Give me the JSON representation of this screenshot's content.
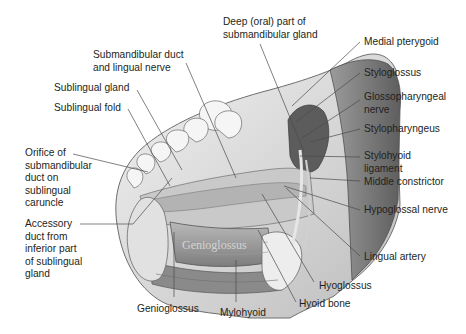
{
  "figure": {
    "colors": {
      "ink": "#231f20",
      "leader": "#4a4a4a",
      "tissue_light": "#d9d9d9",
      "tissue_mid": "#a8a8a8",
      "tissue_dark": "#6e6e6e",
      "bone": "#ececec",
      "background": "#ffffff"
    },
    "watermark_text": "Genioglossus"
  },
  "labels": {
    "deep_part": "Deep (oral) part of\nsubmandibular gland",
    "submandibular_duct": "Submandibular duct\nand lingual nerve",
    "sublingual_gland": "Sublingual gland",
    "sublingual_fold": "Sublingual fold",
    "orifice": "Orifice of\nsubmandibular\nduct on\nsublingual\ncaruncle",
    "accessory_duct": "Accessory\nduct from\ninferior part\nof sublingual\ngland",
    "genioglossus": "Genioglossus",
    "mylohyoid": "Mylohyoid",
    "hyoid_bone": "Hyoid bone",
    "hyoglossus": "Hyoglossus",
    "lingual_artery": "Lingual artery",
    "hypoglossal_nerve": "Hypoglossal nerve",
    "middle_constrictor": "Middle constrictor",
    "stylohyoid_ligament": "Stylohyoid\nligament",
    "stylopharyngeus": "Stylopharyngeus",
    "glossopharyngeal_nerve": "Glossopharyngeal\nnerve",
    "styloglossus": "Styloglossus",
    "medial_pterygoid": "Medial pterygoid"
  }
}
